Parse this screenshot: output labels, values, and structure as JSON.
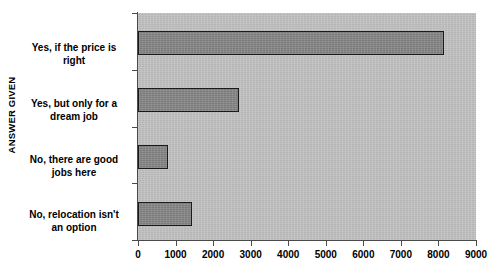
{
  "chart_data": {
    "type": "bar",
    "orientation": "horizontal",
    "title": "",
    "xlabel": "",
    "ylabel": "ANSWER GIVEN",
    "categories": [
      "Yes, if the price is right",
      "Yes, but only for a dream job",
      "No, there are good jobs here",
      "No, relocation isn't an option"
    ],
    "category_lines": [
      [
        "Yes, if the price is",
        "right"
      ],
      [
        "Yes, but only for a",
        "dream job"
      ],
      [
        "No, there are good",
        "jobs here"
      ],
      [
        "No, relocation isn't",
        "an option"
      ]
    ],
    "values": [
      8150,
      2700,
      800,
      1450
    ],
    "xlim": [
      0,
      9000
    ],
    "xticks": [
      0,
      1000,
      2000,
      3000,
      4000,
      5000,
      6000,
      7000,
      8000,
      9000
    ],
    "xtick_labels": [
      "0",
      "1000",
      "2000",
      "3000",
      "4000",
      "5000",
      "6000",
      "7000",
      "8000",
      "9000"
    ],
    "grid": false,
    "legend": false,
    "colors": {
      "bar_fill": "#8a8a8a",
      "bar_border": "#1a1a1a",
      "plot_background": "#c2c2c2",
      "page_background": "#ffffff",
      "axis": "#4a4a4a",
      "text": "#000000"
    }
  }
}
